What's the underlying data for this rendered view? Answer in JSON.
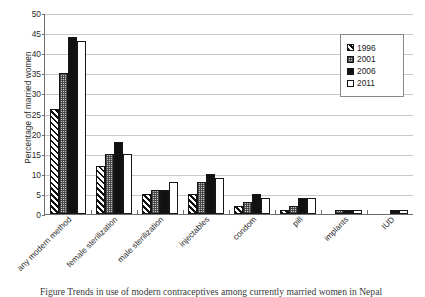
{
  "chart_data": {
    "type": "bar",
    "title": "",
    "xlabel": "",
    "ylabel": "Percentage of married women",
    "ylim": [
      0,
      50
    ],
    "ytick_step": 5,
    "yticks": [
      0,
      5,
      10,
      15,
      20,
      25,
      30,
      35,
      40,
      45,
      50
    ],
    "grid": "horizontal",
    "legend_position": "top-right",
    "categories": [
      "any modern method",
      "female sterilization",
      "male sterilization",
      "injectables",
      "condom",
      "pill",
      "implants",
      "IUD"
    ],
    "series": [
      {
        "name": "1996",
        "values": [
          26,
          12,
          5,
          5,
          2,
          1,
          0,
          0
        ]
      },
      {
        "name": "2001",
        "values": [
          35,
          15,
          6,
          8,
          3,
          2,
          1,
          0
        ]
      },
      {
        "name": "2006",
        "values": [
          44,
          18,
          6,
          10,
          5,
          4,
          1,
          1
        ]
      },
      {
        "name": "2011",
        "values": [
          43,
          15,
          8,
          9,
          4,
          4,
          1,
          1
        ]
      }
    ]
  },
  "legend": {
    "entries": [
      {
        "label": "1996",
        "pattern": "diagonal-hatch"
      },
      {
        "label": "2001",
        "pattern": "gray-dotted"
      },
      {
        "label": "2006",
        "pattern": "solid-black"
      },
      {
        "label": "2011",
        "pattern": "white-empty"
      }
    ]
  },
  "caption": {
    "text": "Figure  Trends in use of modern contraceptives among currently married women in Nepal"
  }
}
